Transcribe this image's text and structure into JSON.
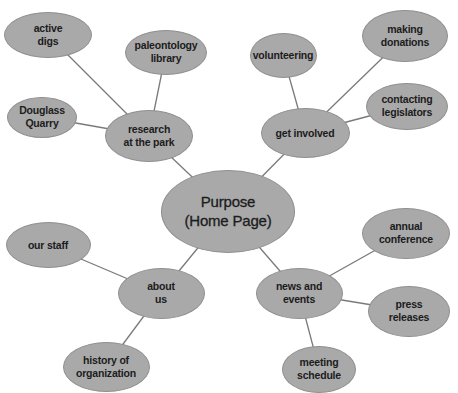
{
  "diagram": {
    "type": "mind-map",
    "fill_color": "#a9a9a9",
    "stroke_color": "#8f8f8f",
    "edge_color": "#7a7a7a",
    "text_color": "#1c1c1c",
    "center": {
      "id": "purpose",
      "label": "Purpose\n(Home Page)",
      "cx": 228,
      "cy": 211,
      "w": 134,
      "h": 83
    },
    "branches": [
      {
        "id": "research",
        "label": "research\nat the park",
        "cx": 149,
        "cy": 136,
        "w": 88,
        "h": 52,
        "children": [
          {
            "id": "active-digs",
            "label": "active\ndigs",
            "cx": 48,
            "cy": 35,
            "w": 88,
            "h": 46
          },
          {
            "id": "paleontology-library",
            "label": "paleontology\nlibrary",
            "cx": 166,
            "cy": 52,
            "w": 82,
            "h": 45
          },
          {
            "id": "douglass-quarry",
            "label": "Douglass\nQuarry",
            "cx": 42,
            "cy": 117,
            "w": 70,
            "h": 41
          }
        ]
      },
      {
        "id": "get-involved",
        "label": "get involved",
        "cx": 305,
        "cy": 133,
        "w": 89,
        "h": 50,
        "children": [
          {
            "id": "volunteering",
            "label": "volunteering",
            "cx": 283,
            "cy": 55,
            "w": 67,
            "h": 45
          },
          {
            "id": "making-donations",
            "label": "making\ndonations",
            "cx": 405,
            "cy": 36,
            "w": 86,
            "h": 52
          },
          {
            "id": "contacting-legislators",
            "label": "contacting\nlegislators",
            "cx": 407,
            "cy": 106,
            "w": 82,
            "h": 47
          }
        ]
      },
      {
        "id": "about-us",
        "label": "about\nus",
        "cx": 161,
        "cy": 293,
        "w": 87,
        "h": 51,
        "children": [
          {
            "id": "our-staff",
            "label": "our staff",
            "cx": 48,
            "cy": 245,
            "w": 85,
            "h": 46
          },
          {
            "id": "history-of-organization",
            "label": "history of\norganization",
            "cx": 106,
            "cy": 367,
            "w": 87,
            "h": 50
          }
        ]
      },
      {
        "id": "news-and-events",
        "label": "news and\nevents",
        "cx": 299,
        "cy": 293,
        "w": 87,
        "h": 51,
        "children": [
          {
            "id": "annual-conference",
            "label": "annual\nconference",
            "cx": 406,
            "cy": 233,
            "w": 88,
            "h": 51
          },
          {
            "id": "press-releases",
            "label": "press\nreleases",
            "cx": 409,
            "cy": 311,
            "w": 82,
            "h": 51
          },
          {
            "id": "meeting-schedule",
            "label": "meeting\nschedule",
            "cx": 319,
            "cy": 369,
            "w": 74,
            "h": 47
          }
        ]
      }
    ]
  }
}
